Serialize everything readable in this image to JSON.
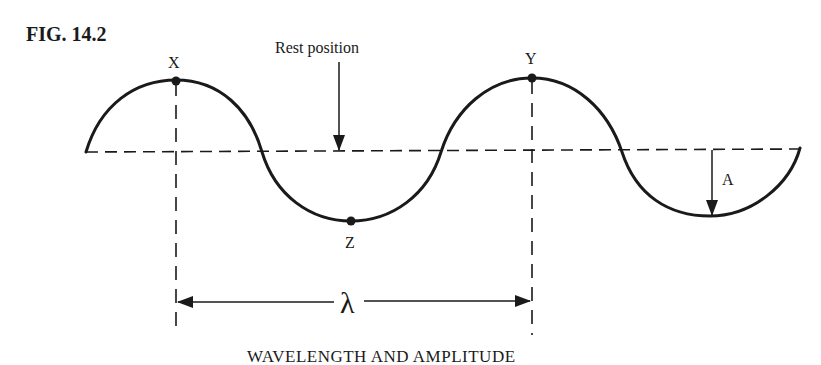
{
  "figure": {
    "number": "FIG. 14.2",
    "caption": "WAVELENGTH AND AMPLITUDE",
    "labels": {
      "rest_position": "Rest position",
      "crest_x": "X",
      "crest_y": "Y",
      "trough_z": "Z",
      "amplitude": "A",
      "wavelength": "λ"
    }
  },
  "colors": {
    "ink": "#1a1a1a",
    "background": "#ffffff"
  }
}
